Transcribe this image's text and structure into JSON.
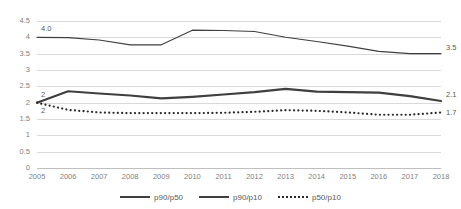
{
  "chart_data": {
    "type": "line",
    "title": "",
    "subtitle": "",
    "xlabel": "",
    "ylabel": "",
    "categories": [
      "2005",
      "2006",
      "2007",
      "2008",
      "2009",
      "2010",
      "2011",
      "2012",
      "2013",
      "2014",
      "2015",
      "2016",
      "2017",
      "2018"
    ],
    "ylim": [
      0,
      4.5
    ],
    "yticks": [
      "0",
      "0.5",
      "1",
      "1.5",
      "2",
      "2.5",
      "3",
      "3.5",
      "4",
      "4.5"
    ],
    "ytick_values": [
      0,
      0.5,
      1,
      1.5,
      2,
      2.5,
      3,
      3.5,
      4,
      4.5
    ],
    "grid": true,
    "legend_position": "bottom",
    "series": [
      {
        "name": "p90/p50",
        "style": "thick-solid",
        "color": "#3f3f3f",
        "values": [
          2.0,
          2.35,
          2.28,
          2.22,
          2.13,
          2.18,
          2.25,
          2.32,
          2.42,
          2.34,
          2.32,
          2.31,
          2.2,
          2.05
        ],
        "start_label": "2",
        "end_label": "2.1"
      },
      {
        "name": "p90/p10",
        "style": "thin-solid",
        "color": "#3f3f3f",
        "values": [
          4.0,
          3.99,
          3.92,
          3.77,
          3.77,
          4.22,
          4.21,
          4.18,
          4.0,
          3.87,
          3.73,
          3.57,
          3.5,
          3.5
        ],
        "start_label": "4.0",
        "end_label": "3.5"
      },
      {
        "name": "p50/p10",
        "style": "dotted",
        "color": "#2b2b2b",
        "values": [
          2.0,
          1.78,
          1.7,
          1.68,
          1.68,
          1.68,
          1.69,
          1.72,
          1.77,
          1.75,
          1.7,
          1.63,
          1.63,
          1.7
        ],
        "start_label": "2",
        "end_label": "1.7"
      }
    ],
    "data_labels": [
      {
        "text": "4.0",
        "series": "p90/p10",
        "position": "start"
      },
      {
        "text": "3.5",
        "series": "p90/p10",
        "position": "end"
      },
      {
        "text": "2",
        "series": "p90/p50",
        "position": "start"
      },
      {
        "text": "2.1",
        "series": "p90/p50",
        "position": "end"
      },
      {
        "text": "2",
        "series": "p50/p10",
        "position": "start"
      },
      {
        "text": "1.7",
        "series": "p50/p10",
        "position": "end"
      }
    ]
  },
  "legend": {
    "items": [
      {
        "label": "p90/p50"
      },
      {
        "label": "p90/p10"
      },
      {
        "label": "p50/p10"
      }
    ]
  }
}
